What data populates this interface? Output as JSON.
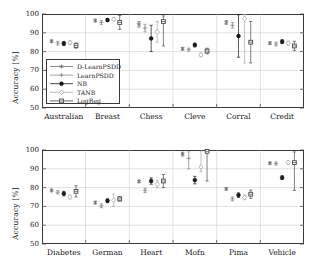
{
  "figure": {
    "ylabel": "Accuracy [%]",
    "yticks": [
      "100",
      "90",
      "80",
      "70",
      "60",
      "50"
    ],
    "ylim": [
      50,
      100
    ],
    "legend_position": "inside-lower-left-top-panel",
    "grid": "horizontal"
  },
  "legend": {
    "entries": [
      {
        "label": "D-LearnPSDD",
        "marker": "asterisk",
        "color": "#6e6e6e"
      },
      {
        "label": "LearnPSDD",
        "marker": "plus",
        "color": "#8a8a8a"
      },
      {
        "label": "NB",
        "marker": "circle-filled",
        "color": "#1a1a1a"
      },
      {
        "label": "TANB",
        "marker": "diamond",
        "color": "#a8a8a8"
      },
      {
        "label": "LogReg",
        "marker": "square",
        "color": "#4a4a4a"
      }
    ]
  },
  "chart_data": [
    {
      "type": "scatter",
      "title": "",
      "xlabel": "",
      "ylabel": "Accuracy [%]",
      "ylim": [
        50,
        100
      ],
      "yticks": [
        50,
        60,
        70,
        80,
        90,
        100
      ],
      "categories": [
        "Australian",
        "Breast",
        "Chess",
        "Cleve",
        "Corral",
        "Credit"
      ],
      "series": [
        {
          "name": "D-LearnPSDD",
          "values": [
            85.5,
            96.5,
            94.5,
            81.5,
            95.5,
            84.5
          ],
          "err_low": [
            84.8,
            95.8,
            93.0,
            80.8,
            94.5,
            83.8
          ],
          "err_high": [
            86.2,
            97.2,
            96.0,
            82.2,
            96.5,
            85.2
          ]
        },
        {
          "name": "LearnPSDD",
          "values": [
            84.5,
            95.5,
            92.5,
            81.0,
            94.0,
            84.0
          ],
          "err_low": [
            83.5,
            94.5,
            90.5,
            80.2,
            92.5,
            83.0
          ],
          "err_high": [
            85.5,
            96.5,
            94.5,
            81.8,
            95.5,
            85.0
          ]
        },
        {
          "name": "NB",
          "values": [
            84.3,
            96.8,
            87.0,
            83.5,
            88.3,
            85.3
          ],
          "err_low": [
            83.2,
            96.0,
            80.0,
            82.5,
            77.0,
            84.3
          ],
          "err_high": [
            85.4,
            97.6,
            94.0,
            84.5,
            99.6,
            86.3
          ]
        },
        {
          "name": "TANB",
          "values": [
            84.8,
            97.2,
            90.5,
            78.3,
            97.5,
            84.5
          ],
          "err_low": [
            83.8,
            96.4,
            85.0,
            77.3,
            74.0,
            83.5
          ],
          "err_high": [
            85.8,
            98.0,
            96.0,
            79.3,
            99.8,
            85.5
          ]
        },
        {
          "name": "LogReg",
          "values": [
            83.2,
            95.5,
            96.0,
            80.3,
            85.0,
            83.0
          ],
          "err_low": [
            81.8,
            91.8,
            83.0,
            78.8,
            74.0,
            80.5
          ],
          "err_high": [
            84.6,
            99.2,
            99.0,
            81.8,
            96.0,
            85.5
          ]
        }
      ]
    },
    {
      "type": "scatter",
      "title": "",
      "xlabel": "",
      "ylabel": "Accuracy [%]",
      "ylim": [
        50,
        100
      ],
      "yticks": [
        50,
        60,
        70,
        80,
        90,
        100
      ],
      "categories": [
        "Diabetes",
        "German",
        "Heart",
        "Mofn",
        "Pima",
        "Vehicle"
      ],
      "series": [
        {
          "name": "D-LearnPSDD",
          "values": [
            78.5,
            72.0,
            83.3,
            97.8,
            79.3,
            93.0
          ],
          "err_low": [
            77.8,
            71.3,
            82.6,
            96.8,
            78.6,
            92.4
          ],
          "err_high": [
            79.2,
            72.7,
            84.0,
            98.8,
            80.0,
            93.6
          ]
        },
        {
          "name": "LearnPSDD",
          "values": [
            77.5,
            70.3,
            78.5,
            95.5,
            74.0,
            92.8
          ],
          "err_low": [
            76.6,
            69.3,
            77.4,
            90.0,
            73.0,
            92.0
          ],
          "err_high": [
            78.4,
            71.3,
            79.6,
            99.0,
            75.0,
            93.6
          ]
        },
        {
          "name": "NB",
          "values": [
            76.8,
            73.0,
            83.5,
            84.0,
            76.0,
            85.3
          ],
          "err_low": [
            75.6,
            72.0,
            81.8,
            82.0,
            74.8,
            84.3
          ],
          "err_high": [
            78.0,
            74.0,
            85.2,
            86.0,
            77.2,
            86.3
          ]
        },
        {
          "name": "TANB",
          "values": [
            75.0,
            73.3,
            81.8,
            91.0,
            74.8,
            93.3
          ],
          "err_low": [
            74.0,
            70.0,
            79.8,
            88.5,
            73.5,
            92.3
          ],
          "err_high": [
            76.0,
            76.6,
            83.8,
            99.5,
            76.1,
            94.3
          ]
        },
        {
          "name": "LogReg",
          "values": [
            78.0,
            74.0,
            83.5,
            99.3,
            76.5,
            93.3
          ],
          "err_low": [
            75.0,
            72.8,
            80.0,
            83.5,
            74.3,
            78.5
          ],
          "err_high": [
            81.0,
            75.2,
            87.0,
            99.9,
            78.7,
            99.0
          ]
        }
      ]
    }
  ]
}
